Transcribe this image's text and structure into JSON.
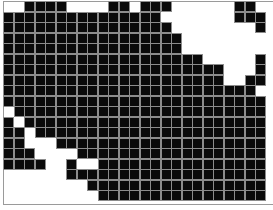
{
  "board": {
    "cols": 25,
    "rows": 19,
    "cell_pitch_px": 10.5,
    "cell_size_px": 9,
    "colors": {
      "alive": "#0a0a0a",
      "dead": "#ffffff",
      "grid_line": "#8c8c8c",
      "border": "#9a9a9a"
    },
    "cells": [
      "..####....##.###......##.",
      "###############.......###",
      "################........#",
      "#################........",
      "#################........",
      "###################.....#",
      "#####################...#",
      "#####################..##",
      "########################.",
      "#########################",
      ".########################",
      "#.#######################",
      "##.######################",
      "##...####################",
      "###....##################",
      "####..#..################",
      "......###################",
      "........#################",
      ".........################"
    ]
  }
}
